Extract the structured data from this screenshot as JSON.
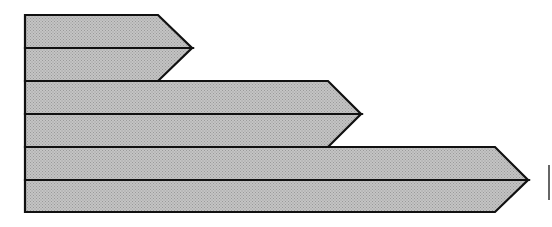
{
  "diagram": {
    "type": "stacked-arrow-bars",
    "canvas": {
      "width": 552,
      "height": 227
    },
    "fill_color": "#c4c4c4",
    "fill_dot_color": "#9a9a9a",
    "stroke_color": "#111111",
    "left_x": 25,
    "arrows": [
      {
        "name": "arrow-1",
        "top": 15,
        "middle": 48,
        "bottom": 81,
        "shaft_end_x": 158,
        "tip_x": 192
      },
      {
        "name": "arrow-2",
        "top": 81,
        "middle": 114,
        "bottom": 147,
        "shaft_end_x": 328,
        "tip_x": 361
      },
      {
        "name": "arrow-3",
        "top": 147,
        "middle": 180,
        "bottom": 212,
        "shaft_end_x": 495,
        "tip_x": 528
      }
    ],
    "edge_mark": {
      "x": 549,
      "y1": 165,
      "y2": 200
    }
  }
}
